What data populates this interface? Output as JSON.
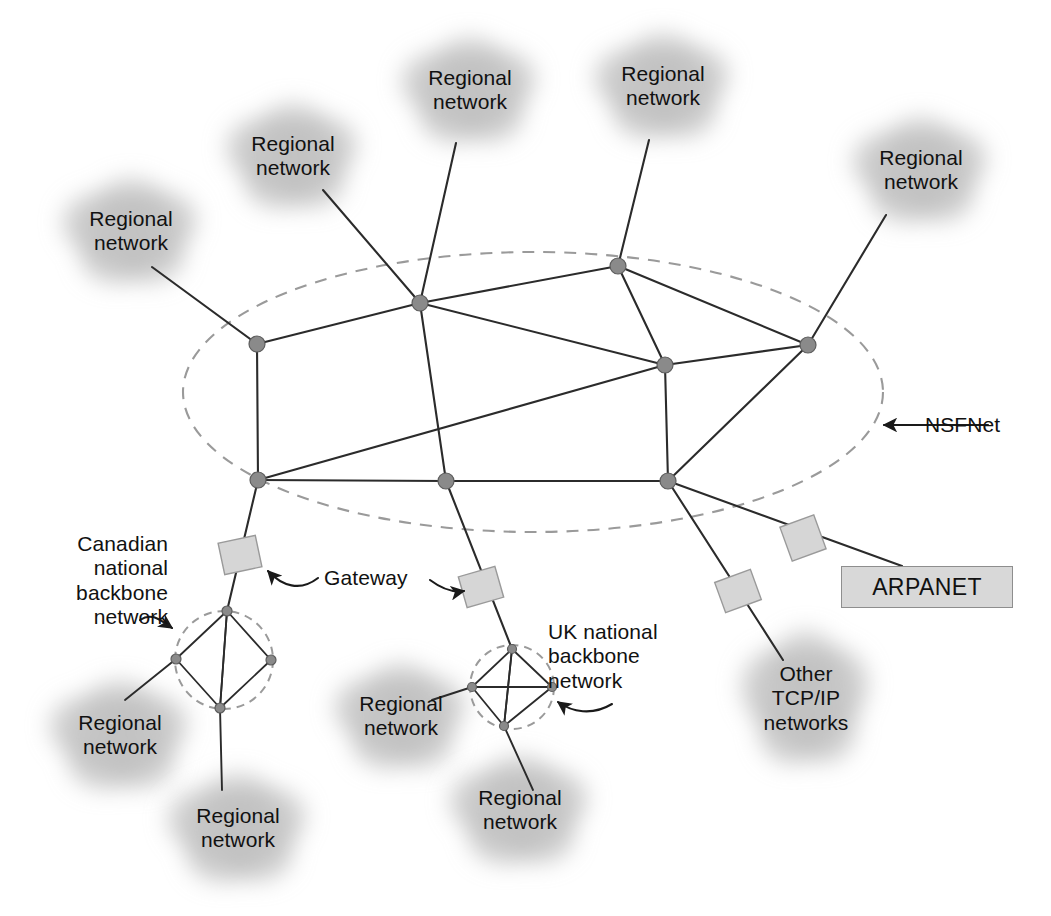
{
  "figure": {
    "kind": "network-topology-diagram"
  },
  "colors": {
    "line": "#2b2b2b",
    "node_fill": "#8a8a8a",
    "node_stroke": "#5d5d5d",
    "dashed_boundary": "#9a9a9a",
    "cloud_fill": "#bfbfbf",
    "gateway_fill": "#d6d6d6",
    "gateway_stroke": "#9a9a9a",
    "arpanet_fill": "#d8d8d8",
    "arpanet_stroke": "#8e8e8e",
    "text": "#111111"
  },
  "labels": {
    "nsfnet": "NSFNet",
    "gateway": "Gateway",
    "arpanet": "ARPANET",
    "canadian_backbone": "Canadian\nnational\nbackbone\nnetwork",
    "uk_backbone": "UK national\nbackbone\nnetwork",
    "other_tcpip": "Other\nTCP/IP\nnetworks",
    "regional": "Regional\nnetwork"
  },
  "clouds": [
    {
      "id": "regional-top-left",
      "label": "Regional\nnetwork",
      "cx": 131,
      "cy": 233,
      "rx": 74,
      "ry": 60
    },
    {
      "id": "regional-top-mid-left",
      "label": "Regional\nnetwork",
      "cx": 293,
      "cy": 158,
      "rx": 72,
      "ry": 60
    },
    {
      "id": "regional-top-center",
      "label": "Regional\nnetwork",
      "cx": 470,
      "cy": 92,
      "rx": 74,
      "ry": 60
    },
    {
      "id": "regional-top-right",
      "label": "Regional\nnetwork",
      "cx": 663,
      "cy": 88,
      "rx": 74,
      "ry": 60
    },
    {
      "id": "regional-far-right",
      "label": "Regional\nnetwork",
      "cx": 921,
      "cy": 172,
      "rx": 74,
      "ry": 60
    },
    {
      "id": "regional-bottom-left",
      "label": "Regional\nnetwork",
      "cx": 120,
      "cy": 737,
      "rx": 76,
      "ry": 62
    },
    {
      "id": "regional-bottom-mid",
      "label": "Regional\nnetwork",
      "cx": 238,
      "cy": 830,
      "rx": 76,
      "ry": 62
    },
    {
      "id": "regional-uk-left",
      "label": "Regional\nnetwork",
      "cx": 401,
      "cy": 718,
      "rx": 72,
      "ry": 60
    },
    {
      "id": "regional-uk-bottom",
      "label": "Regional\nnetwork",
      "cx": 520,
      "cy": 812,
      "rx": 76,
      "ry": 62
    },
    {
      "id": "other-tcpip-cloud",
      "label": "Other\nTCP/IP\nnetworks",
      "cx": 806,
      "cy": 700,
      "rx": 70,
      "ry": 76
    }
  ],
  "nsfnet": {
    "name": "NSFNet",
    "boundary": {
      "cx": 533,
      "cy": 392,
      "rx": 350,
      "ry": 140
    },
    "nodes": [
      {
        "id": "n-west",
        "x": 257,
        "y": 344
      },
      {
        "id": "n-north-mid",
        "x": 420,
        "y": 303
      },
      {
        "id": "n-north-east",
        "x": 618,
        "y": 266
      },
      {
        "id": "n-east",
        "x": 808,
        "y": 345
      },
      {
        "id": "n-center-east",
        "x": 665,
        "y": 365
      },
      {
        "id": "n-southwest",
        "x": 258,
        "y": 480
      },
      {
        "id": "n-south-mid",
        "x": 446,
        "y": 481
      },
      {
        "id": "n-southeast",
        "x": 668,
        "y": 481
      }
    ],
    "links": [
      [
        "n-west",
        "n-north-mid"
      ],
      [
        "n-west",
        "n-southwest"
      ],
      [
        "n-north-mid",
        "n-north-east"
      ],
      [
        "n-north-mid",
        "n-center-east"
      ],
      [
        "n-north-mid",
        "n-south-mid"
      ],
      [
        "n-north-east",
        "n-center-east"
      ],
      [
        "n-north-east",
        "n-east"
      ],
      [
        "n-center-east",
        "n-east"
      ],
      [
        "n-center-east",
        "n-southwest"
      ],
      [
        "n-center-east",
        "n-southeast"
      ],
      [
        "n-east",
        "n-southeast"
      ],
      [
        "n-southwest",
        "n-south-mid"
      ],
      [
        "n-south-mid",
        "n-southeast"
      ]
    ],
    "external_links": [
      {
        "from": "regional-top-left",
        "to": "n-west",
        "x1": 152,
        "y1": 267,
        "x2": 257,
        "y2": 344
      },
      {
        "from": "regional-top-mid-left",
        "to": "n-north-mid",
        "x1": 323,
        "y1": 190,
        "x2": 420,
        "y2": 303
      },
      {
        "from": "regional-top-center",
        "to": "n-north-mid",
        "x1": 456,
        "y1": 143,
        "x2": 420,
        "y2": 303
      },
      {
        "from": "regional-top-right",
        "to": "n-north-east",
        "x1": 649,
        "y1": 140,
        "x2": 618,
        "y2": 266
      },
      {
        "from": "regional-far-right",
        "to": "n-east",
        "x1": 886,
        "y1": 215,
        "x2": 808,
        "y2": 345
      }
    ]
  },
  "canadian": {
    "label": "Canadian\nnational\nbackbone\nnetwork",
    "boundary": {
      "cx": 224,
      "cy": 660,
      "r": 49
    },
    "nodes": [
      {
        "id": "ca-top",
        "x": 227,
        "y": 611
      },
      {
        "id": "ca-left",
        "x": 176,
        "y": 659
      },
      {
        "id": "ca-right",
        "x": 271,
        "y": 660
      },
      {
        "id": "ca-bottom",
        "x": 220,
        "y": 708
      }
    ],
    "links": [
      [
        "ca-top",
        "ca-left"
      ],
      [
        "ca-top",
        "ca-right"
      ],
      [
        "ca-top",
        "ca-bottom"
      ],
      [
        "ca-left",
        "ca-bottom"
      ],
      [
        "ca-right",
        "ca-bottom"
      ]
    ],
    "uplink": {
      "from": "n-southwest",
      "to": "ca-top",
      "x1": 258,
      "y1": 480,
      "x2": 227,
      "y2": 611
    },
    "downlinks": [
      {
        "to": "regional-bottom-left",
        "x1": 176,
        "y1": 659,
        "x2": 125,
        "y2": 700
      },
      {
        "to": "regional-bottom-mid",
        "x1": 220,
        "y1": 708,
        "x2": 222,
        "y2": 790
      }
    ]
  },
  "uk": {
    "label": "UK national\nbackbone\nnetwork",
    "boundary": {
      "cx": 512,
      "cy": 687,
      "r": 42
    },
    "nodes": [
      {
        "id": "uk-top",
        "x": 512,
        "y": 649
      },
      {
        "id": "uk-left",
        "x": 472,
        "y": 687
      },
      {
        "id": "uk-right",
        "x": 552,
        "y": 687
      },
      {
        "id": "uk-bottom",
        "x": 504,
        "y": 726
      }
    ],
    "links": [
      [
        "uk-top",
        "uk-left"
      ],
      [
        "uk-top",
        "uk-right"
      ],
      [
        "uk-top",
        "uk-bottom"
      ],
      [
        "uk-left",
        "uk-right"
      ],
      [
        "uk-left",
        "uk-bottom"
      ],
      [
        "uk-right",
        "uk-bottom"
      ]
    ],
    "uplink": {
      "from": "n-south-mid",
      "to": "uk-top",
      "x1": 446,
      "y1": 481,
      "x2": 512,
      "y2": 649
    },
    "downlinks": [
      {
        "to": "regional-uk-left",
        "x1": 472,
        "y1": 687,
        "x2": 432,
        "y2": 700
      },
      {
        "to": "regional-uk-bottom",
        "x1": 504,
        "y1": 726,
        "x2": 533,
        "y2": 790
      }
    ]
  },
  "gateways": [
    {
      "id": "gw-canada",
      "x": 240,
      "y": 555,
      "w": 38,
      "h": 32,
      "rotate": -12
    },
    {
      "id": "gw-uk",
      "x": 481,
      "y": 587,
      "w": 38,
      "h": 32,
      "rotate": -16
    },
    {
      "id": "gw-other",
      "x": 738,
      "y": 591,
      "w": 38,
      "h": 32,
      "rotate": -20
    },
    {
      "id": "gw-arpanet",
      "x": 803,
      "y": 538,
      "w": 36,
      "h": 36,
      "rotate": -20
    }
  ],
  "arpanet": {
    "label": "ARPANET",
    "box": {
      "x": 841,
      "y": 566,
      "w": 172,
      "h": 42
    },
    "link": {
      "x1": 668,
      "y1": 481,
      "x2": 902,
      "y2": 566
    }
  },
  "other_tcpip": {
    "label": "Other\nTCP/IP\nnetworks",
    "link": {
      "x1": 668,
      "y1": 481,
      "x2": 783,
      "y2": 660
    }
  },
  "annotations": [
    {
      "id": "nsfnet-callout",
      "text": "NSFNet",
      "text_x": 925,
      "text_y": 413,
      "arrow": {
        "tail_x": 988,
        "tail_y": 425,
        "head_x": 884,
        "head_y": 425,
        "style": "straight"
      }
    },
    {
      "id": "gateway-callout",
      "text": "Gateway",
      "text_x": 324,
      "text_y": 566,
      "arrow_left": {
        "style": "curved",
        "head_x": 264,
        "head_y": 567
      },
      "arrow_right": {
        "style": "curved",
        "head_x": 460,
        "head_y": 590
      }
    },
    {
      "id": "canadian-callout",
      "text": "Canadian\nnational\nbackbone\nnetwork",
      "text_x": 58,
      "text_y": 532,
      "arrow": {
        "style": "curved",
        "head_x": 173,
        "head_y": 628
      }
    },
    {
      "id": "uk-callout",
      "text": "UK national\nbackbone\nnetwork",
      "text_x": 548,
      "text_y": 620,
      "arrow": {
        "style": "curved",
        "head_x": 555,
        "head_y": 700
      }
    }
  ]
}
